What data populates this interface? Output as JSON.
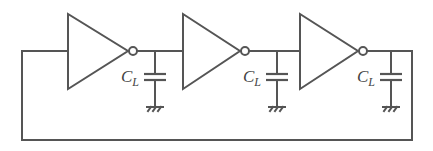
{
  "diagram": {
    "colors": {
      "stroke": "#555555",
      "background": "#ffffff",
      "label": "#444444"
    },
    "feedback": {
      "left_x": 22,
      "bottom_y": 140,
      "right_x": 412,
      "signal_y": 51
    },
    "stages": [
      {
        "id": 1,
        "tri_left": 68,
        "tri_tip": 128,
        "top": 14,
        "bottom": 89,
        "bubble_cx": 133,
        "cap_x": 155,
        "label_main": "C",
        "label_sub": "L"
      },
      {
        "id": 2,
        "tri_left": 183,
        "tri_tip": 240,
        "top": 14,
        "bottom": 89,
        "bubble_cx": 245,
        "cap_x": 277,
        "label_main": "C",
        "label_sub": "L"
      },
      {
        "id": 3,
        "tri_left": 300,
        "tri_tip": 358,
        "top": 14,
        "bottom": 89,
        "bubble_cx": 363,
        "cap_x": 391,
        "label_main": "C",
        "label_sub": "L"
      }
    ],
    "capacitor": {
      "plate_top_y": 74,
      "plate_bottom_y": 80,
      "plate_half_width": 11,
      "ground_y": 107
    },
    "bubble_r": 4
  }
}
